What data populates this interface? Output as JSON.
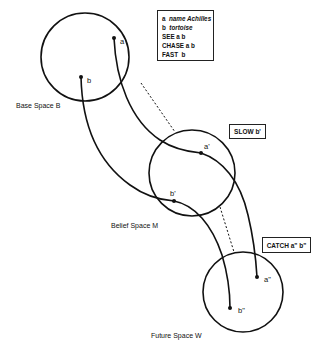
{
  "spaces": [
    {
      "id": "base",
      "label": "Base Space B"
    },
    {
      "id": "belief",
      "label": "Belief Space M"
    },
    {
      "id": "future",
      "label": "Future Space W"
    }
  ],
  "points": {
    "a": "a",
    "b": "b",
    "a1": "a'",
    "b1": "b'",
    "a2": "a\"",
    "b2": "b\""
  },
  "legend": {
    "lines": [
      {
        "key": "a",
        "value": "name Achilles"
      },
      {
        "key": "b",
        "value": "tortoise"
      },
      {
        "key": "SEE",
        "value": "a b"
      },
      {
        "key": "CHASE",
        "value": "a b"
      },
      {
        "key": "FAST",
        "value": "b"
      }
    ]
  },
  "tags": {
    "slow": "SLOW b'",
    "catch": "CATCH a\" b\""
  },
  "colors": {
    "stroke": "#111111",
    "background": "#ffffff"
  }
}
